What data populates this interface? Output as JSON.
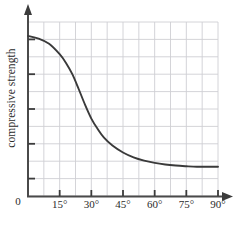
{
  "chart_data": {
    "type": "line",
    "title": "",
    "xlabel": "",
    "ylabel": "compressive strength",
    "xlim": [
      0,
      90
    ],
    "ylim": [
      0,
      1
    ],
    "grid": true,
    "legend": false,
    "x_tick_labels": [
      "0",
      "15°",
      "30°",
      "45°",
      "60°",
      "75°",
      "90°"
    ],
    "x_tick_values": [
      0,
      15,
      30,
      45,
      60,
      75,
      90
    ],
    "y_tick_labels": [
      "",
      "",
      "",
      "",
      ""
    ],
    "origin_label": "0",
    "x_grid_step_deg": 7.5,
    "y_grid_count": 10,
    "series": [
      {
        "name": "compressive strength vs angle",
        "color": "#3a3a3a",
        "x": [
          0,
          5,
          10,
          15,
          18,
          21,
          24,
          27,
          30,
          33,
          36,
          40,
          45,
          50,
          55,
          60,
          65,
          70,
          75,
          80,
          85,
          90
        ],
        "y": [
          0.92,
          0.905,
          0.875,
          0.815,
          0.765,
          0.7,
          0.615,
          0.525,
          0.445,
          0.385,
          0.335,
          0.29,
          0.25,
          0.222,
          0.203,
          0.19,
          0.181,
          0.175,
          0.171,
          0.168,
          0.168,
          0.168
        ]
      }
    ]
  },
  "axes": {
    "x_axis_name": "angle-axis",
    "y_axis_name": "compressive-strength-axis",
    "x_arrow": "arrow-right",
    "y_arrow": "arrow-up"
  },
  "colors": {
    "curve": "#3a3a3a",
    "axis": "#4a4a4a",
    "grid": "#cfcfd4",
    "text": "#2b2b2b",
    "background": "#ffffff"
  }
}
